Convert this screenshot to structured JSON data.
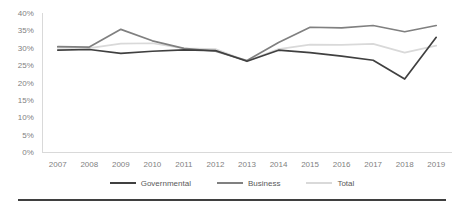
{
  "chart_data": {
    "type": "line",
    "title": "",
    "subtitle": "",
    "xlabel": "",
    "ylabel": "",
    "categories": [
      "2007",
      "2008",
      "2009",
      "2010",
      "2011",
      "2012",
      "2013",
      "2014",
      "2015",
      "2016",
      "2017",
      "2018",
      "2019"
    ],
    "ylim": [
      0,
      40
    ],
    "ytick_step": 5,
    "ytick_labels": [
      "40%",
      "35%",
      "30%",
      "25%",
      "20%",
      "15%",
      "10%",
      "5%",
      "0%"
    ],
    "ytick_values": [
      40,
      35,
      30,
      25,
      20,
      15,
      10,
      5,
      0
    ],
    "grid": false,
    "legend_position": "bottom",
    "series": [
      {
        "name": "Governmental",
        "color": "#404040",
        "width": 1.7,
        "values": [
          29.3,
          29.5,
          28.4,
          29.0,
          29.4,
          29.2,
          26.1,
          29.3,
          28.6,
          27.6,
          26.4,
          21.0,
          33.0
        ]
      },
      {
        "name": "Business",
        "color": "#808080",
        "width": 1.7,
        "values": [
          30.3,
          30.2,
          35.3,
          32.0,
          29.8,
          29.0,
          26.3,
          31.5,
          35.9,
          35.7,
          36.4,
          34.6,
          36.4
        ]
      },
      {
        "name": "Total",
        "color": "#d9d9d9",
        "width": 1.7,
        "values": [
          30.0,
          29.9,
          31.2,
          31.3,
          29.8,
          29.6,
          26.2,
          29.6,
          30.9,
          30.8,
          31.1,
          28.6,
          30.6
        ]
      }
    ]
  },
  "axis": {
    "line_color": "#d9d9d9",
    "tick_text_color": "#7f7f7f"
  },
  "legend": {
    "items": [
      {
        "label": "Governmental",
        "color": "#404040"
      },
      {
        "label": "Business",
        "color": "#808080"
      },
      {
        "label": "Total",
        "color": "#d9d9d9"
      }
    ]
  }
}
